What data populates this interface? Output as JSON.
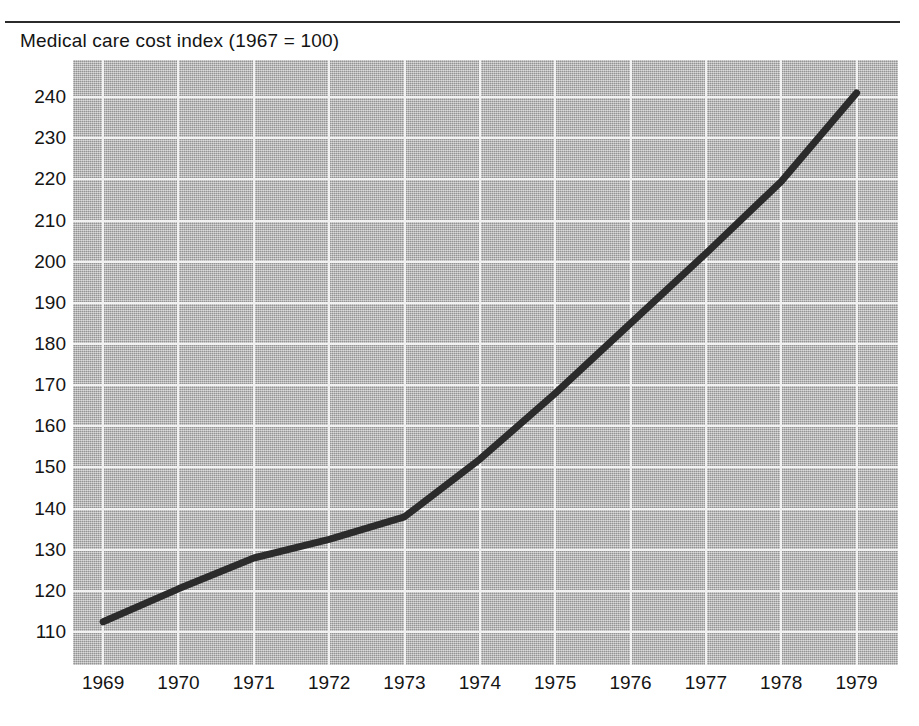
{
  "chart_data": {
    "type": "line",
    "title": "Medical care cost index (1967 = 100)",
    "xlabel": "",
    "ylabel": "",
    "x": [
      1969,
      1970,
      1971,
      1972,
      1973,
      1974,
      1975,
      1976,
      1977,
      1978,
      1979
    ],
    "categories": [
      "1969",
      "1970",
      "1971",
      "1972",
      "1973",
      "1974",
      "1975",
      "1976",
      "1977",
      "1978",
      "1979"
    ],
    "values": [
      112.5,
      120.5,
      128.0,
      132.5,
      138.0,
      152.0,
      168.0,
      185.0,
      202.0,
      219.5,
      241.0
    ],
    "series": [
      {
        "name": "Medical care cost index",
        "values": [
          112.5,
          120.5,
          128.0,
          132.5,
          138.0,
          152.0,
          168.0,
          185.0,
          202.0,
          219.5,
          241.0
        ]
      }
    ],
    "ylim": [
      102,
      249
    ],
    "xlim": [
      1968.6,
      1979.55
    ],
    "ytick_labels": [
      "240",
      "230",
      "220",
      "210",
      "200",
      "190",
      "180",
      "170",
      "160",
      "150",
      "140",
      "130",
      "120",
      "110"
    ],
    "ytick_values": [
      240,
      230,
      220,
      210,
      200,
      190,
      180,
      170,
      160,
      150,
      140,
      130,
      120,
      110
    ],
    "xtick_labels": [
      "1969",
      "1970",
      "1971",
      "1972",
      "1973",
      "1974",
      "1975",
      "1976",
      "1977",
      "1978",
      "1979"
    ],
    "grid": true,
    "grid_color": "#f2f2f2",
    "plot_background": "#b5b5b5",
    "line_color": "#2b2b2b",
    "line_width": 7,
    "legend": "none"
  },
  "figure": {
    "title": "Medical care cost index (1967 = 100)",
    "rule_color": "#2b2b2b"
  }
}
